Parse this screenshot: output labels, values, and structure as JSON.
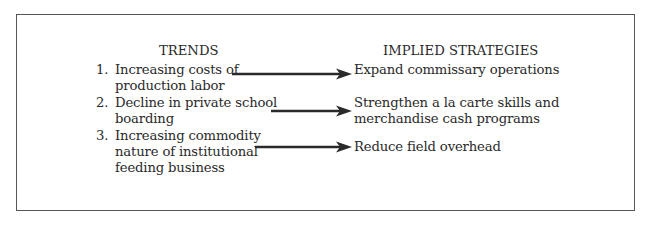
{
  "diagram": {
    "headers": {
      "left": "TRENDS",
      "right": "IMPLIED STRATEGIES"
    },
    "trends": [
      {
        "number": "1.",
        "lines": [
          "Increasing costs of",
          "production labor"
        ]
      },
      {
        "number": "2.",
        "lines": [
          "Decline in private school",
          "boarding"
        ]
      },
      {
        "number": "3.",
        "lines": [
          "Increasing commodity",
          "nature of institutional",
          "feeding business"
        ]
      }
    ],
    "strategies": [
      {
        "lines": [
          "Expand commissary operations"
        ]
      },
      {
        "lines": [
          "Strengthen a la carte skills and",
          "merchandise cash programs"
        ]
      },
      {
        "lines": [
          "Reduce field overhead"
        ]
      }
    ],
    "arrows": [
      {
        "from": "trend-1",
        "to": "strategy-1"
      },
      {
        "from": "trend-2",
        "to": "strategy-2"
      },
      {
        "from": "trend-3",
        "to": "strategy-3"
      }
    ]
  }
}
